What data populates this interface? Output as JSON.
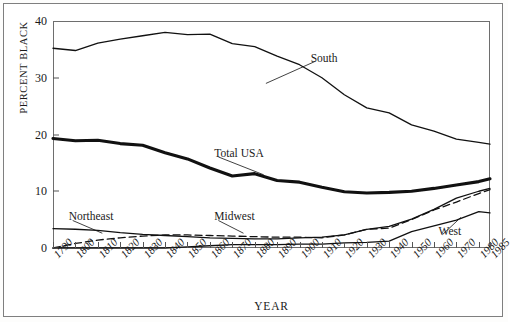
{
  "chart_data": {
    "type": "line",
    "title": "",
    "xlabel": "YEAR",
    "ylabel": "PERCENT BLACK",
    "xlim": [
      1790,
      1985
    ],
    "ylim": [
      0,
      40
    ],
    "grid": false,
    "legend_position": "inline-annotations",
    "x": [
      1790,
      1800,
      1810,
      1820,
      1830,
      1840,
      1850,
      1860,
      1870,
      1880,
      1890,
      1900,
      1910,
      1920,
      1930,
      1940,
      1950,
      1960,
      1970,
      1980,
      1985
    ],
    "xticklabels": [
      "1790",
      "1800",
      "1810",
      "1820",
      "1830",
      "1840",
      "1850",
      "1860",
      "1870",
      "1880",
      "1890",
      "1900",
      "1910",
      "1920",
      "1930",
      "1940",
      "1950",
      "1960",
      "1970",
      "1980",
      "1985"
    ],
    "yticklabels": [
      "0",
      "10",
      "20",
      "30",
      "40"
    ],
    "yticks": [
      0,
      10,
      20,
      30,
      40
    ],
    "series": [
      {
        "name": "South",
        "style": "solid-thin",
        "label": "South",
        "values": [
          35.2,
          34.8,
          36.1,
          36.8,
          37.4,
          38.0,
          37.6,
          37.7,
          36.0,
          35.5,
          33.8,
          32.3,
          30.0,
          27.0,
          24.7,
          23.8,
          21.7,
          20.6,
          19.2,
          18.6,
          18.3
        ]
      },
      {
        "name": "Total USA",
        "style": "solid-thick",
        "label": "Total USA",
        "values": [
          19.3,
          18.9,
          19.0,
          18.4,
          18.1,
          16.8,
          15.7,
          14.1,
          12.7,
          13.1,
          11.9,
          11.6,
          10.7,
          9.9,
          9.7,
          9.8,
          10.0,
          10.5,
          11.1,
          11.7,
          12.2
        ]
      },
      {
        "name": "Northeast",
        "style": "solid-thin",
        "label": "Northeast",
        "values": [
          3.4,
          3.3,
          3.1,
          2.7,
          2.4,
          2.2,
          2.0,
          1.8,
          1.7,
          1.6,
          1.6,
          1.8,
          1.9,
          2.3,
          3.3,
          3.8,
          5.1,
          6.8,
          8.8,
          10.0,
          10.5
        ]
      },
      {
        "name": "Midwest",
        "style": "dashed",
        "label": "Midwest",
        "values": [
          0.0,
          0.8,
          1.4,
          1.8,
          2.1,
          2.3,
          2.3,
          2.2,
          2.1,
          2.0,
          1.9,
          1.9,
          1.8,
          2.3,
          3.3,
          3.5,
          5.0,
          6.7,
          8.1,
          9.6,
          10.3
        ]
      },
      {
        "name": "West",
        "style": "solid-thin",
        "label": "West",
        "values": [
          0.0,
          0.0,
          0.0,
          0.0,
          0.0,
          0.0,
          0.2,
          0.4,
          0.6,
          0.6,
          0.6,
          0.7,
          0.7,
          0.9,
          1.0,
          1.2,
          2.9,
          3.9,
          4.9,
          6.4,
          6.2
        ]
      }
    ],
    "annotations": [
      {
        "text": "South",
        "x": 1905,
        "y": 33.2,
        "leader_to": {
          "x": 1885,
          "y": 29.0
        }
      },
      {
        "text": "Total USA",
        "x": 1862,
        "y": 16.4,
        "leader_to": {
          "x": 1884,
          "y": 12.9
        }
      },
      {
        "text": "Northeast",
        "x": 1797,
        "y": 5.2,
        "leader_to": {
          "x": 1812,
          "y": 2.6
        }
      },
      {
        "text": "Midwest",
        "x": 1862,
        "y": 5.2,
        "leader_to": {
          "x": 1875,
          "y": 2.6
        }
      },
      {
        "text": "West",
        "x": 1962,
        "y": 2.7,
        "leader_to": {
          "x": 1972,
          "y": 5.4
        }
      }
    ]
  }
}
